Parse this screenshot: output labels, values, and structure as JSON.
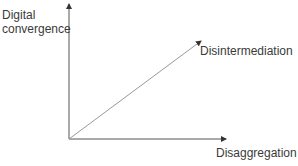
{
  "diagram": {
    "type": "axes-with-vector",
    "y_axis": {
      "label_line1": "Digital",
      "label_line2": "convergence"
    },
    "x_axis": {
      "label": "Disaggregation"
    },
    "vector": {
      "label": "Disintermediation"
    },
    "colors": {
      "axis": "#444444",
      "vector": "#888888",
      "text": "#3a3a3a"
    }
  }
}
